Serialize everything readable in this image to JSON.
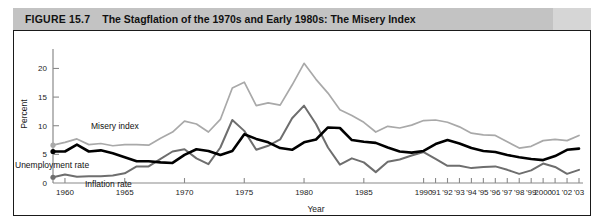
{
  "figure": {
    "number_label": "FIGURE 15.7",
    "title": "The Stagflation of the 1970s and Early 1980s: The Misery Index"
  },
  "chart_data": {
    "type": "line",
    "title": "The Stagflation of the 1970s and Early 1980s: The Misery Index",
    "xlabel": "Year",
    "ylabel": "Percent",
    "xlim": [
      1959,
      2003
    ],
    "ylim": [
      0,
      22
    ],
    "yticks": [
      0,
      5,
      10,
      15,
      20
    ],
    "ytick_labels": [
      "0",
      "5",
      "10",
      "15",
      "20"
    ],
    "grid": false,
    "legend": "inline-annotations",
    "x": [
      1959,
      1960,
      1961,
      1962,
      1963,
      1964,
      1965,
      1966,
      1967,
      1968,
      1969,
      1970,
      1971,
      1972,
      1973,
      1974,
      1975,
      1976,
      1977,
      1978,
      1979,
      1980,
      1981,
      1982,
      1983,
      1984,
      1985,
      1986,
      1987,
      1988,
      1989,
      1990,
      1991,
      1992,
      1993,
      1994,
      1995,
      1996,
      1997,
      1998,
      1999,
      2000,
      2001,
      2002,
      2003
    ],
    "xtick_values": [
      1960,
      1965,
      1970,
      1975,
      1980,
      1985,
      1990,
      1991,
      1992,
      1993,
      1994,
      1995,
      1996,
      1997,
      1998,
      1999,
      2000,
      2001,
      2002,
      2003
    ],
    "xtick_labels": [
      "1960",
      "1965",
      "1970",
      "1975",
      "1980",
      "1985",
      "1990",
      "'91",
      "'92",
      "'93",
      "'94",
      "'95",
      "'96",
      "'97",
      "'98",
      "'99",
      "2000",
      "'01",
      "'02",
      "'03"
    ],
    "series": [
      {
        "name": "Misery index",
        "color": "#a9a9a9",
        "label_text": "Misery index",
        "values": [
          6.6,
          7.1,
          7.7,
          6.7,
          6.9,
          6.5,
          6.7,
          6.7,
          6.6,
          7.8,
          8.9,
          10.8,
          10.3,
          8.9,
          11.1,
          16.6,
          17.6,
          13.5,
          14.0,
          13.6,
          17.1,
          20.9,
          18.1,
          15.7,
          12.8,
          11.8,
          10.6,
          8.9,
          9.9,
          9.6,
          10.1,
          10.9,
          11.0,
          10.6,
          9.8,
          8.7,
          8.4,
          8.3,
          7.2,
          6.1,
          6.4,
          7.4,
          7.6,
          7.4,
          8.3
        ]
      },
      {
        "name": "Inflation rate",
        "color": "#6e6e6e",
        "label_text": "Inflation rate",
        "values": [
          1.0,
          1.5,
          1.1,
          1.2,
          1.2,
          1.3,
          1.7,
          2.9,
          2.9,
          4.2,
          5.5,
          5.9,
          4.3,
          3.3,
          6.2,
          11.0,
          9.1,
          5.8,
          6.5,
          7.6,
          11.3,
          13.5,
          10.3,
          6.2,
          3.2,
          4.3,
          3.6,
          1.9,
          3.7,
          4.1,
          4.8,
          5.4,
          4.2,
          3.0,
          3.0,
          2.6,
          2.8,
          2.9,
          2.3,
          1.6,
          2.2,
          3.4,
          2.8,
          1.6,
          2.3
        ]
      },
      {
        "name": "Unemployment rate",
        "color": "#000000",
        "label_text": "Unemployment rate",
        "values": [
          5.5,
          5.5,
          6.7,
          5.5,
          5.7,
          5.2,
          4.5,
          3.8,
          3.8,
          3.6,
          3.5,
          4.9,
          5.9,
          5.6,
          4.9,
          5.6,
          8.5,
          7.7,
          7.1,
          6.1,
          5.8,
          7.1,
          7.6,
          9.7,
          9.6,
          7.5,
          7.2,
          7.0,
          6.2,
          5.5,
          5.3,
          5.6,
          6.8,
          7.5,
          6.9,
          6.1,
          5.6,
          5.4,
          4.9,
          4.5,
          4.2,
          4.0,
          4.7,
          5.8,
          6.0
        ]
      }
    ]
  }
}
